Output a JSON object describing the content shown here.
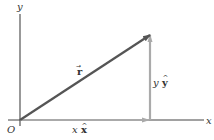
{
  "diagram": {
    "type": "vector-decomposition",
    "axes": {
      "x_label": "x",
      "y_label": "y",
      "origin_label": "O"
    },
    "vectors": [
      {
        "name": "r",
        "label": "r",
        "hat": "→",
        "color": "#555555"
      },
      {
        "name": "x-component",
        "label_var": "x",
        "label_unit": "x",
        "hat": "^",
        "color": "#aaaaaa"
      },
      {
        "name": "y-component",
        "label_var": "y",
        "label_unit": "y",
        "hat": "^",
        "color": "#aaaaaa"
      }
    ],
    "colors": {
      "axis": "#444444",
      "resultant": "#555555",
      "components": "#aaaaaa"
    }
  }
}
